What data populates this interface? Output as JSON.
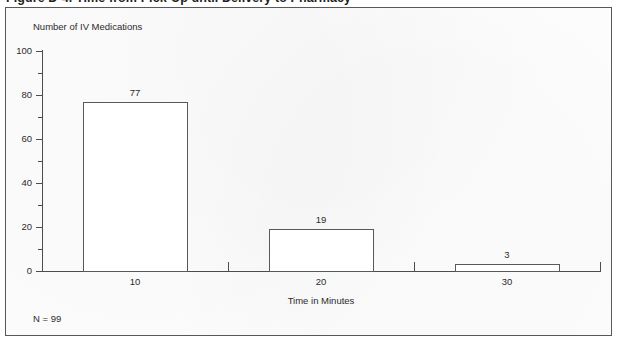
{
  "figure": {
    "caption": "Figure D-4.  Time from Pick-Up until Delivery to Pharmacy",
    "sample_size_note": "N = 99"
  },
  "colors": {
    "frame": "#58585a",
    "axis": "#4d4b4c",
    "bar_outline": "#5a5859",
    "bar_fill": "#ffffff",
    "text": "#2c2a2b",
    "background": "#fdfdfd"
  },
  "chart_data": {
    "type": "bar",
    "title": "Figure D-4.  Time from Pick-Up until Delivery to Pharmacy",
    "categories": [
      "10",
      "20",
      "30"
    ],
    "values": [
      77,
      19,
      3
    ],
    "value_labels": [
      "77",
      "19",
      "3"
    ],
    "xlabel": "Time in Minutes",
    "ylabel": "Number of IV Medications",
    "ylim": [
      0,
      100
    ],
    "y_major_ticks": [
      0,
      20,
      40,
      60,
      80,
      100
    ],
    "y_major_tick_labels": [
      "0",
      "20",
      "40",
      "60",
      "80",
      "100"
    ],
    "y_minor_ticks": [
      10,
      30,
      50,
      70,
      90
    ],
    "grid": false,
    "legend": false,
    "annotation": "N = 99",
    "total": 99
  }
}
